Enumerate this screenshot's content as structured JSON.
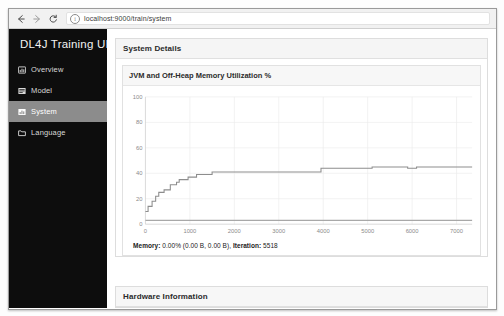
{
  "browser": {
    "back_icon": "back-arrow-icon",
    "forward_icon": "forward-arrow-icon",
    "reload_icon": "reload-icon",
    "info_icon": "info-icon",
    "info_glyph": "i",
    "url": "localhost:9000/train/system"
  },
  "sidebar": {
    "brand": "DL4J Training UI",
    "active_bg": "#8c8c8c",
    "bg": "#0d0d0d",
    "items": [
      {
        "label": "Overview",
        "icon": "overview-chart-icon",
        "active": false
      },
      {
        "label": "Model",
        "icon": "model-layers-icon",
        "active": false
      },
      {
        "label": "System",
        "icon": "system-bars-icon",
        "active": true
      },
      {
        "label": "Language",
        "icon": "language-folder-icon",
        "active": false
      }
    ]
  },
  "main": {
    "system_details_title": "System Details",
    "chart_title": "JVM and Off-Heap Memory Utilization %",
    "hardware_title": "Hardware Information",
    "status": {
      "memory_label": "Memory:",
      "memory_value": "0.00% (0.00 B, 0.00 B),",
      "iteration_label": "Iteration:",
      "iteration_value": "5518"
    }
  },
  "chart_data": {
    "type": "line",
    "title": "JVM and Off-Heap Memory Utilization %",
    "xlabel": "",
    "ylabel": "",
    "xlim": [
      0,
      7350
    ],
    "ylim": [
      0,
      100
    ],
    "grid": true,
    "legend": false,
    "xticks": [
      0,
      1000,
      2000,
      3000,
      4000,
      5000,
      6000,
      7000
    ],
    "yticks": [
      0,
      20,
      40,
      60,
      80,
      100
    ],
    "series": [
      {
        "name": "JVM Memory Utilization %",
        "color": "#8d8d8d",
        "x": [
          0,
          60,
          60,
          150,
          150,
          230,
          230,
          300,
          300,
          420,
          420,
          560,
          560,
          700,
          700,
          760,
          760,
          960,
          960,
          1150,
          1150,
          1500,
          1500,
          3950,
          3950,
          5100,
          5100,
          5900,
          5900,
          6100,
          6100,
          7350
        ],
        "y": [
          10,
          10,
          14,
          14,
          18,
          18,
          22,
          22,
          25,
          25,
          27,
          27,
          31,
          31,
          33,
          33,
          35,
          35,
          37,
          37,
          39,
          39,
          41,
          41,
          44,
          44,
          45,
          45,
          44,
          44,
          45,
          45
        ]
      },
      {
        "name": "Off-Heap Memory Utilization %",
        "color": "#a8a8a8",
        "x": [
          0,
          7350
        ],
        "y": [
          3,
          3
        ]
      }
    ]
  }
}
